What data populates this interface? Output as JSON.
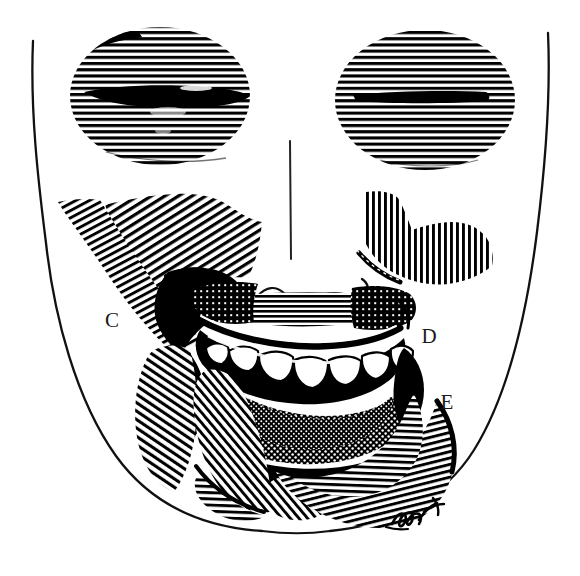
{
  "figure": {
    "kind": "anatomical-line-illustration",
    "style": "pen-and-ink cross-hatch engraving",
    "background_color": "#ffffff",
    "ink_color": "#000000",
    "label_color": "#1a1a1a",
    "width": 580,
    "height": 576
  },
  "labels": [
    {
      "id": "C",
      "text": "C",
      "x": 112,
      "y": 327,
      "describes": "left lateral hatched zone beside angle of mouth"
    },
    {
      "id": "D",
      "text": "D",
      "x": 429,
      "y": 343,
      "describes": "right mid-cheek zone lateral to mouth"
    },
    {
      "id": "E",
      "text": "E",
      "x": 447,
      "y": 409,
      "describes": "right lower zone along mandible"
    }
  ],
  "regions": [
    {
      "name": "left-eye-disc",
      "shading": "horizontal-line-hatch",
      "cx": 160,
      "cy": 96,
      "rx": 90,
      "ry": 69
    },
    {
      "name": "right-eye-disc",
      "shading": "horizontal-line-hatch",
      "cx": 425,
      "cy": 100,
      "rx": 90,
      "ry": 70
    },
    {
      "name": "left-eye-slit",
      "shading": "solid-black",
      "cx": 160,
      "cy": 96
    },
    {
      "name": "right-eye-slit",
      "shading": "solid-black",
      "cx": 425,
      "cy": 100
    },
    {
      "name": "left-cheek-hatch",
      "shading": "diagonal-line-hatch"
    },
    {
      "name": "left-upper-cheek-hatch",
      "shading": "vertical-line-hatch"
    },
    {
      "name": "right-cheek-patch",
      "shading": "vertical-line-hatch"
    },
    {
      "name": "upper-lip-dark-mass",
      "shading": "solid-black"
    },
    {
      "name": "lower-lip-dark-mass",
      "shading": "solid-black"
    },
    {
      "name": "perioral-stipple",
      "shading": "dot-stipple"
    },
    {
      "name": "chin-hatch",
      "shading": "diagonal-line-hatch"
    },
    {
      "name": "mandible-band",
      "shading": "radial-line-hatch"
    },
    {
      "name": "teeth",
      "shading": "white-outlined"
    },
    {
      "name": "face-outline",
      "shading": "contour-stroke"
    },
    {
      "name": "midline",
      "shading": "contour-stroke"
    },
    {
      "name": "philtrum-nose-base",
      "shading": "contour-stroke"
    }
  ],
  "signature": {
    "present": true,
    "kind": "artist-signature",
    "x": 418,
    "y": 518,
    "legible": false
  }
}
